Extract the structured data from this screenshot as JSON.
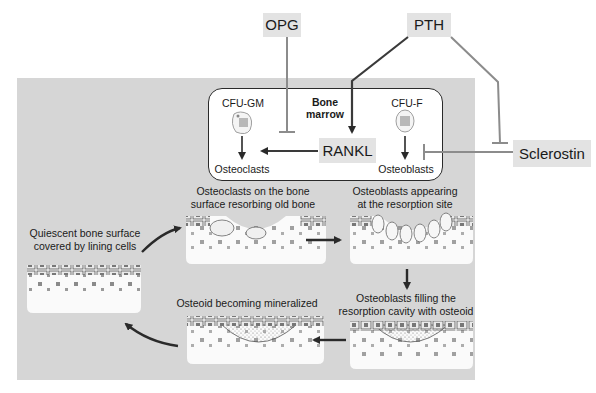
{
  "regulators": {
    "opg": "OPG",
    "pth": "PTH",
    "sclerostin": "Sclerostin",
    "rankl": "RANKL"
  },
  "bone_marrow": {
    "title_line1": "Bone",
    "title_line2": "marrow",
    "cfu_gm": "CFU-GM",
    "cfu_f": "CFU-F",
    "osteoclasts": "Osteoclasts",
    "osteoblasts": "Osteoblasts"
  },
  "stages": [
    {
      "line1": "Quiescent bone surface",
      "line2": "covered by lining cells"
    },
    {
      "line1": "Osteoclasts on the bone",
      "line2": "surface resorbing old bone"
    },
    {
      "line1": "Osteoblasts appearing",
      "line2": "at the resorption site"
    },
    {
      "line1": "Osteoblasts filling the",
      "line2": "resorption cavity with osteoid"
    },
    {
      "line1": "Osteoid becoming mineralized",
      "line2": ""
    }
  ],
  "colors": {
    "panel": "#d6d6d6",
    "tag_box": "#e3e3e3",
    "line_dark": "#3a3a3a",
    "line_gray": "#8c8c8c",
    "bone": "#fafafa"
  }
}
